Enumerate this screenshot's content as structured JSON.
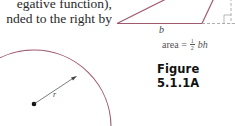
{
  "text": {
    "lines": [
      "egative function),",
      "nded to the right by"
    ]
  },
  "triangle_figure": {
    "base_label": "b",
    "formula_prefix": "area =",
    "fraction_numerator": "1",
    "fraction_denominator": "2",
    "formula_suffix": "bh",
    "caption": "Figure 5.1.1A",
    "stroke_color": "#a05a6e"
  },
  "circle_figure": {
    "radius_label": "r",
    "stroke_color": "#a05a6e"
  }
}
